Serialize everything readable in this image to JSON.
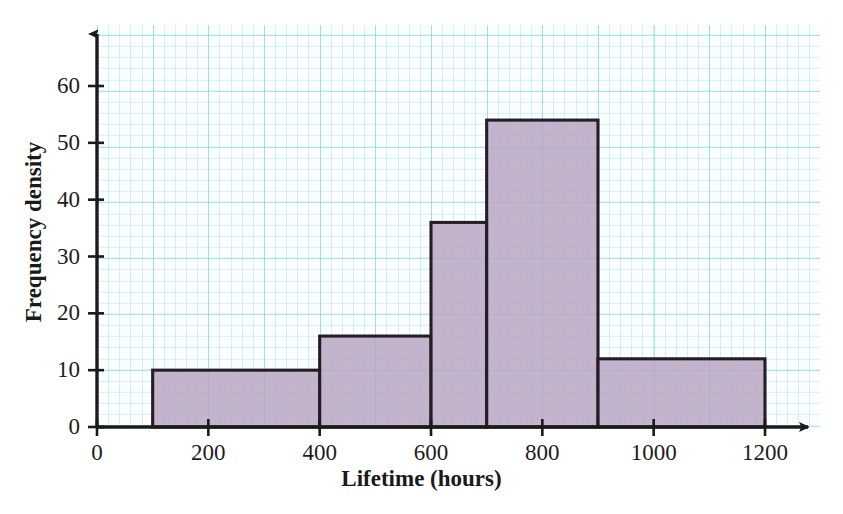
{
  "chart_data": {
    "type": "bar",
    "title": "",
    "subtitle": "",
    "xlabel": "Lifetime (hours)",
    "ylabel": "Frequency density",
    "xlim": [
      0,
      1200
    ],
    "ylim": [
      0,
      67
    ],
    "grid": true,
    "legend": "none",
    "style": "histogram on graph paper",
    "xtick_labels": [
      "0",
      "200",
      "400",
      "600",
      "800",
      "1000",
      "1200"
    ],
    "xticks": [
      0,
      200,
      400,
      600,
      800,
      1000,
      1200
    ],
    "ytick_labels": [
      "0",
      "10",
      "20",
      "30",
      "40",
      "50",
      "60"
    ],
    "yticks": [
      0,
      10,
      20,
      30,
      40,
      50,
      60
    ],
    "bin_edges": [
      100,
      400,
      600,
      700,
      900,
      1200
    ],
    "categories": [
      "100-400",
      "400-600",
      "600-700",
      "700-900",
      "900-1200"
    ],
    "values": [
      10,
      16,
      36,
      54,
      12
    ],
    "bars": [
      {
        "x0": 100,
        "x1": 400,
        "height": 10
      },
      {
        "x0": 400,
        "x1": 600,
        "height": 16
      },
      {
        "x0": 600,
        "x1": 700,
        "height": 36
      },
      {
        "x0": 700,
        "x1": 900,
        "height": 54
      },
      {
        "x0": 900,
        "x1": 1200,
        "height": 12
      }
    ],
    "colors": {
      "bar_fill": "#b7a3bf",
      "bar_outline": "#241f26",
      "axis": "#1a1a1a",
      "grid_major": "#78cde1",
      "grid_minor": "#96dbeb",
      "paper": "#fbfeff",
      "text": "#1c1c1c"
    }
  },
  "axes": {
    "x_title": "Lifetime (hours)",
    "y_title": "Frequency density",
    "x_ticks": [
      {
        "label": "0",
        "value": 0
      },
      {
        "label": "200",
        "value": 200
      },
      {
        "label": "400",
        "value": 400
      },
      {
        "label": "600",
        "value": 600
      },
      {
        "label": "800",
        "value": 800
      },
      {
        "label": "1000",
        "value": 1000
      },
      {
        "label": "1200",
        "value": 1200
      }
    ],
    "y_ticks": [
      {
        "label": "0",
        "value": 0
      },
      {
        "label": "10",
        "value": 10
      },
      {
        "label": "20",
        "value": 20
      },
      {
        "label": "30",
        "value": 30
      },
      {
        "label": "40",
        "value": 40
      },
      {
        "label": "50",
        "value": 50
      },
      {
        "label": "60",
        "value": 60
      }
    ]
  }
}
